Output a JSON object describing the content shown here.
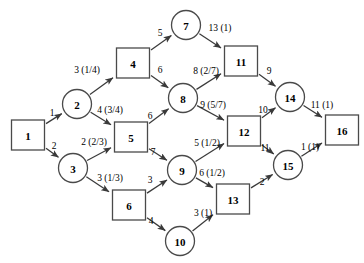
{
  "diagram": {
    "type": "directed-network",
    "node_shapes": {
      "square": "square",
      "circle": "circle"
    },
    "colors": {
      "background": "#ffffff",
      "node_stroke": "#4a4a4a",
      "edge_stroke": "#3a3a3a",
      "text": "#000000"
    },
    "nodes": [
      {
        "id": "1",
        "label": "1",
        "shape": "square",
        "x": 28,
        "y": 135
      },
      {
        "id": "2",
        "label": "2",
        "shape": "circle",
        "x": 77,
        "y": 104
      },
      {
        "id": "3",
        "label": "3",
        "shape": "circle",
        "x": 73,
        "y": 168
      },
      {
        "id": "4",
        "label": "4",
        "shape": "square",
        "x": 133,
        "y": 63
      },
      {
        "id": "5",
        "label": "5",
        "shape": "square",
        "x": 131,
        "y": 137
      },
      {
        "id": "6",
        "label": "6",
        "shape": "square",
        "x": 129,
        "y": 205
      },
      {
        "id": "7",
        "label": "7",
        "shape": "circle",
        "x": 186,
        "y": 25
      },
      {
        "id": "8",
        "label": "8",
        "shape": "circle",
        "x": 183,
        "y": 98
      },
      {
        "id": "9",
        "label": "9",
        "shape": "circle",
        "x": 182,
        "y": 170
      },
      {
        "id": "10",
        "label": "10",
        "shape": "circle",
        "x": 180,
        "y": 241
      },
      {
        "id": "11",
        "label": "11",
        "shape": "square",
        "x": 241,
        "y": 61
      },
      {
        "id": "12",
        "label": "12",
        "shape": "square",
        "x": 244,
        "y": 131
      },
      {
        "id": "13",
        "label": "13",
        "shape": "square",
        "x": 233,
        "y": 199
      },
      {
        "id": "14",
        "label": "14",
        "shape": "circle",
        "x": 290,
        "y": 97
      },
      {
        "id": "15",
        "label": "15",
        "shape": "circle",
        "x": 288,
        "y": 165
      },
      {
        "id": "16",
        "label": "16",
        "shape": "square",
        "x": 342,
        "y": 130
      }
    ],
    "edges": [
      {
        "from": "1",
        "to": "2",
        "label": "1",
        "lx": 52,
        "ly": 113
      },
      {
        "from": "1",
        "to": "3",
        "label": "2",
        "lx": 54,
        "ly": 146
      },
      {
        "from": "2",
        "to": "4",
        "label": "3 (1/4)",
        "lx": 87,
        "ly": 70
      },
      {
        "from": "2",
        "to": "5",
        "label": "4 (3/4)",
        "lx": 110,
        "ly": 110
      },
      {
        "from": "3",
        "to": "5",
        "label": "2 (2/3)",
        "lx": 94,
        "ly": 142
      },
      {
        "from": "3",
        "to": "6",
        "label": "3 (1/3)",
        "lx": 110,
        "ly": 178
      },
      {
        "from": "4",
        "to": "7",
        "label": "5",
        "lx": 160,
        "ly": 33
      },
      {
        "from": "4",
        "to": "8",
        "label": "6",
        "lx": 160,
        "ly": 70
      },
      {
        "from": "5",
        "to": "8",
        "label": "6",
        "lx": 150,
        "ly": 116
      },
      {
        "from": "5",
        "to": "9",
        "label": "7",
        "lx": 153,
        "ly": 152
      },
      {
        "from": "6",
        "to": "9",
        "label": "3",
        "lx": 150,
        "ly": 180
      },
      {
        "from": "6",
        "to": "10",
        "label": "4",
        "lx": 151,
        "ly": 221
      },
      {
        "from": "7",
        "to": "11",
        "label": "13 (1)",
        "lx": 220,
        "ly": 28
      },
      {
        "from": "8",
        "to": "11",
        "label": "8 (2/7)",
        "lx": 206,
        "ly": 71
      },
      {
        "from": "8",
        "to": "12",
        "label": "9 (5/7)",
        "lx": 213,
        "ly": 105
      },
      {
        "from": "9",
        "to": "12",
        "label": "5 (1/2)",
        "lx": 207,
        "ly": 143
      },
      {
        "from": "9",
        "to": "13",
        "label": "6 (1/2)",
        "lx": 212,
        "ly": 173
      },
      {
        "from": "10",
        "to": "13",
        "label": "3 (1)",
        "lx": 203,
        "ly": 213
      },
      {
        "from": "11",
        "to": "14",
        "label": "9",
        "lx": 269,
        "ly": 71
      },
      {
        "from": "12",
        "to": "14",
        "label": "10",
        "lx": 263,
        "ly": 110
      },
      {
        "from": "12",
        "to": "15",
        "label": "11",
        "lx": 265,
        "ly": 148
      },
      {
        "from": "13",
        "to": "15",
        "label": "2",
        "lx": 262,
        "ly": 182
      },
      {
        "from": "14",
        "to": "16",
        "label": "11 (1)",
        "lx": 322,
        "ly": 105
      },
      {
        "from": "15",
        "to": "16",
        "label": "1 (1)",
        "lx": 310,
        "ly": 147
      }
    ]
  }
}
